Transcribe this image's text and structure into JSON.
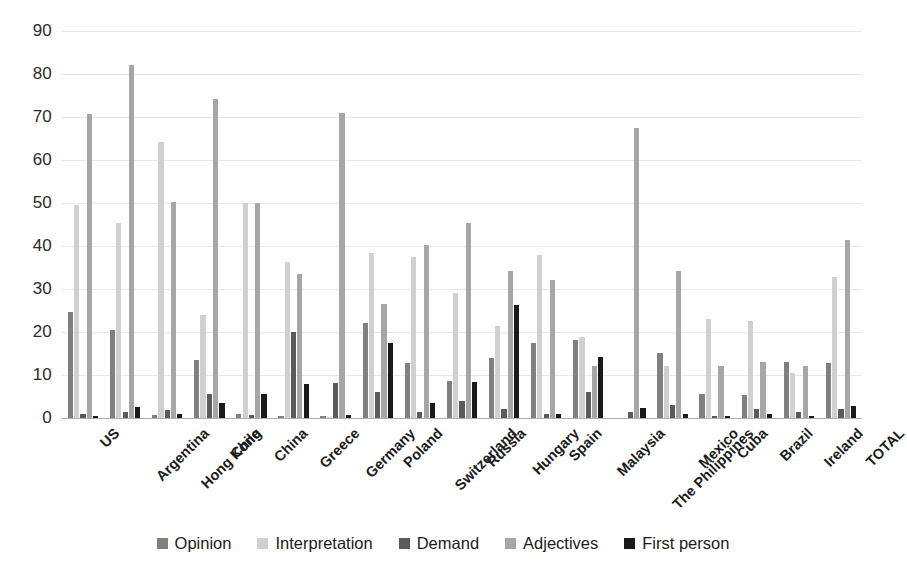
{
  "chart_data": {
    "type": "bar",
    "title": "",
    "subtitle": "",
    "xlabel": "",
    "ylabel": "",
    "ylim": [
      0,
      90
    ],
    "ytick_step": 10,
    "yticks": [
      90,
      80,
      70,
      60,
      50,
      40,
      30,
      20,
      10,
      0
    ],
    "grid": true,
    "legend_position": "bottom",
    "orientation": "vertical",
    "categories": [
      "US",
      "Argentina",
      "Hong Kong",
      "Chile",
      "China",
      "Greece",
      "Germany",
      "Poland",
      "Switzerland",
      "Russia",
      "Hungary",
      "Spain",
      "Malaysia",
      "The Philippines",
      "Mexico",
      "Cuba",
      "Brazil",
      "Ireland",
      "TOTAL"
    ],
    "series": [
      {
        "name": "Opinion",
        "color": "#808080",
        "values": [
          24.7,
          20.5,
          0.6,
          13.5,
          1.0,
          0.5,
          0.4,
          22.2,
          12.7,
          8.7,
          14.0,
          17.4,
          18.2,
          0.0,
          15.2,
          5.5,
          5.3,
          13.0,
          12.7
        ]
      },
      {
        "name": "Interpretation",
        "color": "#d0d0d0",
        "values": [
          49.5,
          45.4,
          64.2,
          24.0,
          50.0,
          36.2,
          0.3,
          38.4,
          37.5,
          29.0,
          21.4,
          38.0,
          18.9,
          0.0,
          12.0,
          23.0,
          22.5,
          10.5,
          32.7
        ]
      },
      {
        "name": "Demand",
        "color": "#5a5a5a",
        "values": [
          1.0,
          1.4,
          1.8,
          5.7,
          0.8,
          20.0,
          8.2,
          6.0,
          1.5,
          4.0,
          2.0,
          1.0,
          6.0,
          1.5,
          3.0,
          0.5,
          2.0,
          1.5,
          2.2
        ]
      },
      {
        "name": "Adjectives",
        "color": "#a6a6a6",
        "values": [
          70.7,
          82.0,
          50.3,
          74.3,
          50.0,
          33.5,
          71.0,
          26.5,
          40.3,
          45.3,
          34.3,
          32.2,
          12.0,
          67.5,
          34.3,
          12.0,
          13.0,
          12.0,
          41.5
        ]
      },
      {
        "name": "First person",
        "color": "#1a1a1a",
        "values": [
          0.5,
          2.5,
          1.0,
          3.5,
          5.7,
          8.0,
          0.6,
          17.5,
          3.5,
          8.3,
          26.3,
          1.0,
          14.2,
          2.3,
          1.0,
          0.5,
          1.0,
          0.4,
          2.8
        ]
      }
    ]
  }
}
